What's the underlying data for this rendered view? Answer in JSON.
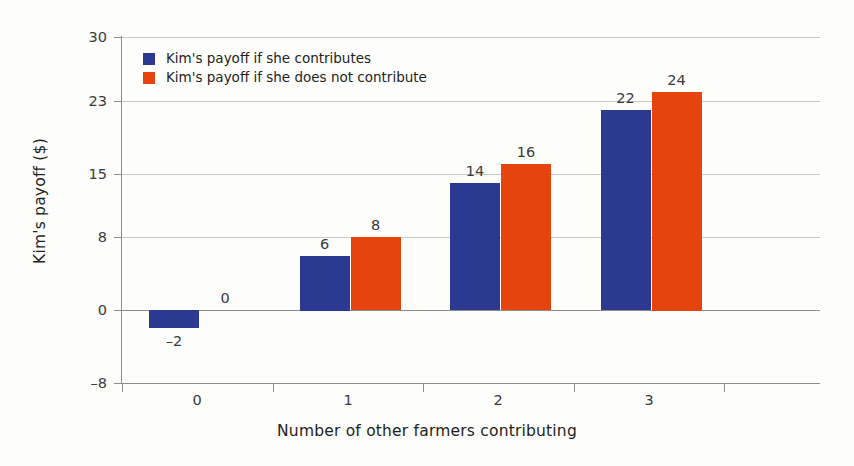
{
  "chart_data": {
    "type": "bar",
    "title": "",
    "xlabel": "Number of other farmers contributing",
    "ylabel": "Kim's payoff ($)",
    "categories": [
      "0",
      "1",
      "2",
      "3"
    ],
    "series": [
      {
        "name": "Kim's payoff if she contributes",
        "color": "#2b3a90",
        "values": [
          -2,
          6,
          14,
          22
        ],
        "value_labels": [
          "–2",
          "6",
          "14",
          "22"
        ]
      },
      {
        "name": "Kim's payoff if she does not contribute",
        "color": "#e5440e",
        "values": [
          0,
          8,
          16,
          24
        ],
        "value_labels": [
          "0",
          "8",
          "16",
          "24"
        ]
      }
    ],
    "ylim": [
      -8,
      30
    ],
    "yticks": [
      30,
      23,
      15,
      8,
      0,
      -8
    ],
    "ytick_labels": [
      "30",
      "23",
      "15",
      "8",
      "0",
      "–8"
    ],
    "xtick_labels": [
      "0",
      "1",
      "2",
      "3"
    ],
    "grid": "horizontal",
    "legend_position": "top-left"
  },
  "legend": {
    "items": [
      {
        "label": "Kim's payoff if she contributes",
        "swatch": "blue"
      },
      {
        "label": "Kim's payoff if she does not contribute",
        "swatch": "red"
      }
    ]
  }
}
